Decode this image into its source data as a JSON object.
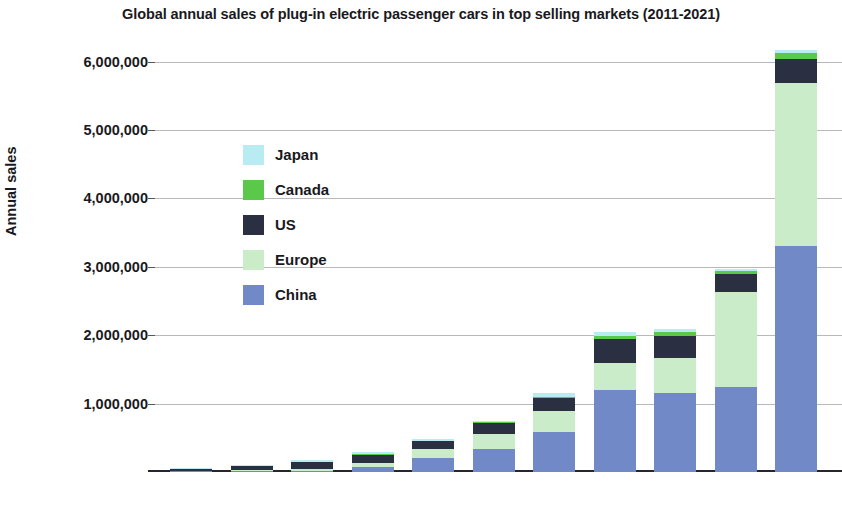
{
  "chart_data": {
    "type": "bar",
    "subtype": "stacked-bar",
    "title": "Global annual sales of plug-in electric passenger cars in top selling markets (2011-2021)",
    "xlabel": "",
    "ylabel": "Annual sales",
    "categories": [
      "2011",
      "2012",
      "2013",
      "2014",
      "2015",
      "2016",
      "2017",
      "2018",
      "2019",
      "2020",
      "2021"
    ],
    "ylim": [
      0,
      6200000
    ],
    "yticks": [
      1000000,
      2000000,
      3000000,
      4000000,
      5000000,
      6000000
    ],
    "ytick_labels": [
      "1,000,000",
      "2,000,000",
      "3,000,000",
      "4,000,000",
      "5,000,000",
      "6,000,000"
    ],
    "grid": true,
    "legend_position": "inside-upper-left",
    "stack_order_bottom_to_top": [
      "China",
      "Europe",
      "US",
      "Canada",
      "Japan"
    ],
    "series": [
      {
        "name": "China",
        "color": "#7289c8",
        "values": [
          8000,
          13000,
          18000,
          75000,
          207000,
          336000,
          579000,
          1204000,
          1152000,
          1246000,
          3300000
        ]
      },
      {
        "name": "Europe",
        "color": "#caecc9",
        "values": [
          12000,
          17000,
          28000,
          60000,
          130000,
          222000,
          306000,
          385000,
          518000,
          1388000,
          2390000
        ]
      },
      {
        "name": "US",
        "color": "#2b2f42",
        "values": [
          18000,
          53000,
          97000,
          119000,
          114000,
          159000,
          195000,
          361000,
          326000,
          259000,
          350000
        ]
      },
      {
        "name": "Canada",
        "color": "#5ac949",
        "values": [
          1000,
          2000,
          4000,
          5000,
          7000,
          11000,
          19000,
          44000,
          51000,
          52000,
          86000
        ]
      },
      {
        "name": "Japan",
        "color": "#b9ecf2",
        "values": [
          14000,
          17000,
          29000,
          34000,
          29000,
          25000,
          56000,
          52000,
          44000,
          31000,
          45000
        ]
      }
    ]
  },
  "legend": {
    "items": [
      {
        "label": "Japan",
        "color": "#b9ecf2"
      },
      {
        "label": "Canada",
        "color": "#5ac949"
      },
      {
        "label": "US",
        "color": "#2b2f42"
      },
      {
        "label": "Europe",
        "color": "#caecc9"
      },
      {
        "label": "China",
        "color": "#7289c8"
      }
    ]
  }
}
